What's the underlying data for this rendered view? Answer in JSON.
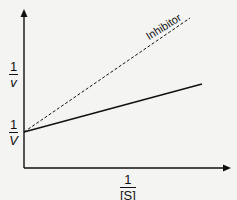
{
  "diagram": {
    "type": "Lineweaver-Burk plot",
    "y_axis_label": {
      "num": "1",
      "den": "v"
    },
    "x_axis_label": {
      "num": "1",
      "den": "[S]"
    },
    "intercept_label": {
      "num": "1",
      "den": "V"
    },
    "lines": [
      {
        "name": "Uninhibited",
        "style": "solid"
      },
      {
        "name": "Inhibitor",
        "style": "dashed",
        "label": "Inhibitor"
      }
    ]
  }
}
